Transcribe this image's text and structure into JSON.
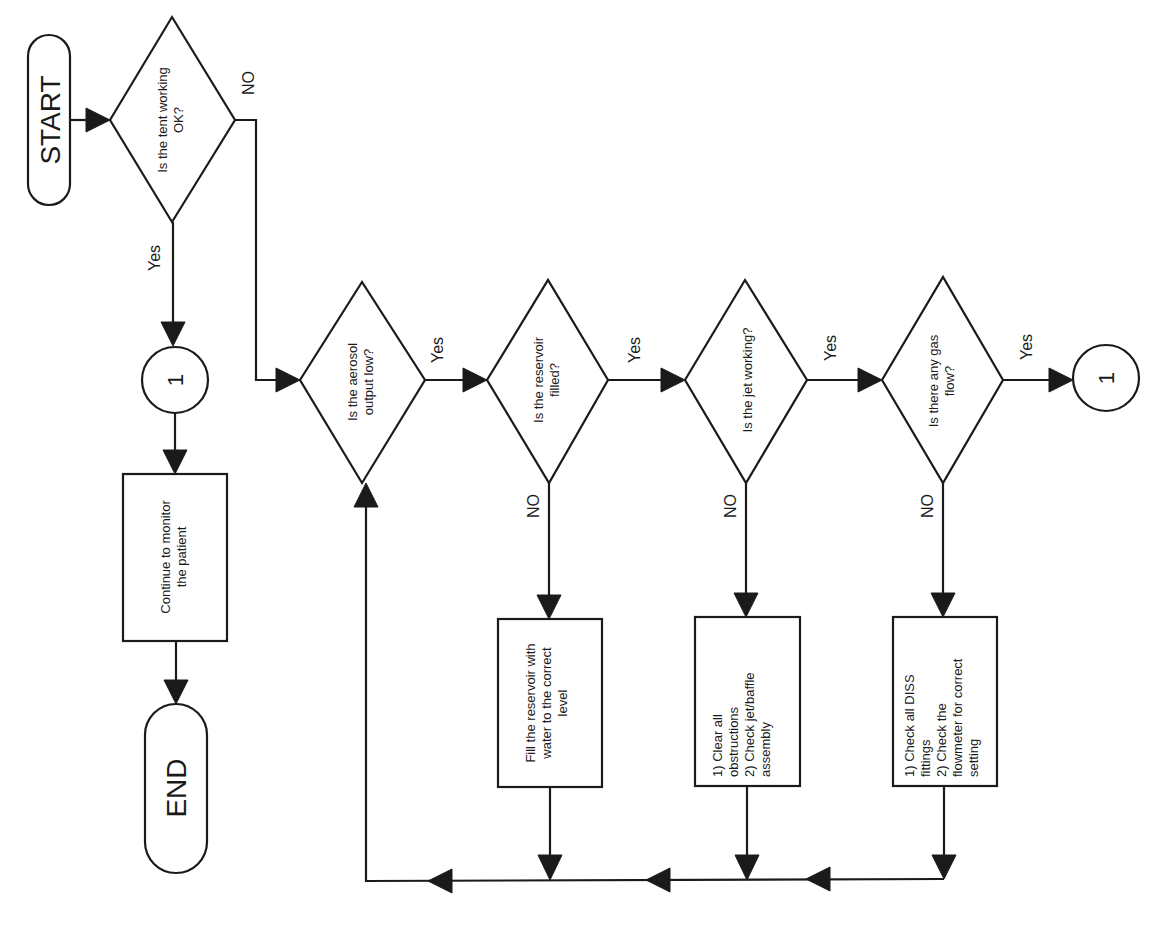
{
  "diagram": {
    "orientation": "rotated 90 degrees counter-clockwise",
    "colors": {
      "stroke": "#1a1a1a",
      "fill": "#ffffff",
      "background": "#ffffff"
    },
    "terminals": {
      "start": "START",
      "end": "END"
    },
    "decisions": {
      "d1": [
        "Is the tent working",
        "OK?"
      ],
      "d2": [
        "Is the aerosol",
        "output low?"
      ],
      "d3": [
        "Is the reservoir",
        "filled?"
      ],
      "d4": [
        "Is the jet working?"
      ],
      "d5": [
        "Is there any gas",
        "flow?"
      ]
    },
    "processes": {
      "monitor": [
        "Continue to monitor",
        "the patient"
      ],
      "fill": [
        "Fill the reservoir with",
        "water to the correct",
        "level"
      ],
      "jet": [
        "1) Clear all",
        "obstructions",
        "2) Check jet/baffle",
        "assembly"
      ],
      "gas": [
        "1) Check all DISS",
        "fittings",
        "2) Check the",
        "flowmeter for correct",
        "setting"
      ]
    },
    "connectors": {
      "c_left": "1",
      "c_right": "1"
    },
    "edge_labels": {
      "d1_yes": "Yes",
      "d1_no": "NO",
      "d2_yes": "Yes",
      "d3_yes": "Yes",
      "d3_no": "NO",
      "d4_yes": "Yes",
      "d4_no": "NO",
      "d5_yes": "Yes",
      "d5_no": "NO"
    }
  }
}
